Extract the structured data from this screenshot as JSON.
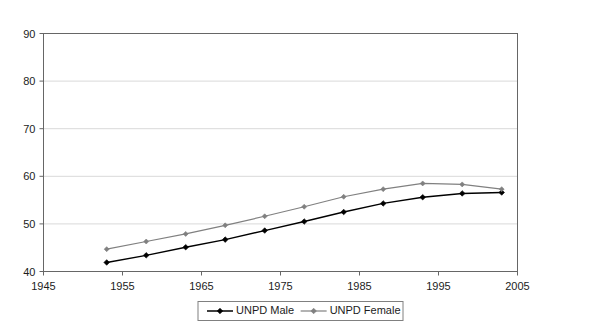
{
  "chart_data": {
    "type": "line",
    "title": "",
    "subtitle": "",
    "xlabel": "",
    "ylabel": "",
    "xlim": [
      1945,
      2005
    ],
    "ylim": [
      40,
      90
    ],
    "xticks": [
      1945,
      1955,
      1965,
      1975,
      1985,
      1995,
      2005
    ],
    "yticks": [
      40,
      50,
      60,
      70,
      80,
      90
    ],
    "xtick_labels": [
      "1945",
      "1955",
      "1965",
      "1975",
      "1985",
      "1995",
      "2005"
    ],
    "ytick_labels": [
      "40",
      "50",
      "60",
      "70",
      "80",
      "90"
    ],
    "grid": "horizontal",
    "legend_position": "bottom",
    "x": [
      1953,
      1958,
      1963,
      1968,
      1973,
      1978,
      1983,
      1988,
      1993,
      1998,
      2003
    ],
    "series": [
      {
        "name": "UNPD Male",
        "color": "#000000",
        "marker": "diamond",
        "values": [
          41.9,
          43.4,
          45.1,
          46.7,
          48.6,
          50.5,
          52.5,
          54.3,
          55.6,
          56.4,
          56.6
        ]
      },
      {
        "name": "UNPD Female",
        "color": "#808080",
        "marker": "diamond",
        "values": [
          44.7,
          46.3,
          47.9,
          49.7,
          51.6,
          53.6,
          55.7,
          57.3,
          58.5,
          58.3,
          57.3
        ]
      }
    ]
  },
  "legend": {
    "items": [
      {
        "label": "UNPD Male",
        "color": "#000000"
      },
      {
        "label": "UNPD Female",
        "color": "#808080"
      }
    ]
  }
}
